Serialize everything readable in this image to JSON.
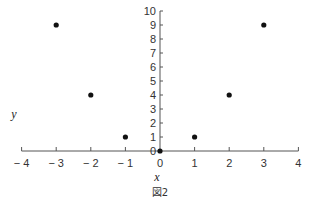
{
  "chart_data": {
    "type": "scatter",
    "title": "",
    "caption": "図2",
    "xlabel": "x",
    "ylabel": "y",
    "xlim": [
      -4,
      4
    ],
    "ylim": [
      0,
      10
    ],
    "grid": false,
    "x_ticks": [
      -4,
      -3,
      -2,
      -1,
      0,
      1,
      2,
      3,
      4
    ],
    "x_tick_labels": [
      "−4",
      "−3",
      "−2",
      "−1",
      "0",
      "1",
      "2",
      "3",
      "4"
    ],
    "y_ticks": [
      0,
      1,
      2,
      3,
      4,
      5,
      6,
      7,
      8,
      9,
      10
    ],
    "y_tick_labels": [
      "0",
      "1",
      "2",
      "3",
      "4",
      "5",
      "6",
      "7",
      "8",
      "9",
      "10"
    ],
    "series": [
      {
        "name": "points",
        "x": [
          -3,
          -2,
          -1,
          0,
          1,
          2,
          3
        ],
        "y": [
          9,
          4,
          1,
          0,
          1,
          4,
          9
        ]
      }
    ],
    "colors": {
      "axis": "#555555",
      "point": "#111111"
    }
  }
}
